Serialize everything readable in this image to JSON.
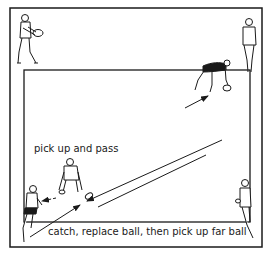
{
  "diagram": {
    "labels": {
      "pick_up_and_pass": "pick up and pass",
      "catch_replace": "catch, replace ball, then pick up far ball"
    },
    "colors": {
      "line": "#1a1a1a",
      "background": "#ffffff"
    },
    "elements": [
      "outer-boundary",
      "inner-boundary",
      "player-top-left-holding-ball",
      "player-top-right-standing",
      "player-bending-picking-up-far-ball",
      "player-crouching-near-ball",
      "player-bottom-left-running",
      "player-bottom-right-standing",
      "ball-near",
      "pass-arrows"
    ]
  }
}
